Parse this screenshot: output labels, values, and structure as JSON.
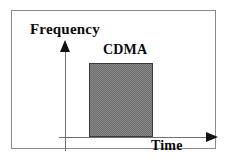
{
  "figure": {
    "name": "cdma-time-frequency-diagram",
    "background_color": "#ffffff",
    "frame_color": "#8a8a8a"
  },
  "chart_data": {
    "type": "area",
    "title": "",
    "xlabel": "Time",
    "ylabel": "Frequency",
    "grid": false,
    "legend": null,
    "axes": {
      "x": {
        "label": "Time",
        "arrow": "right",
        "ticks": [],
        "tick_labels": []
      },
      "y": {
        "label": "Frequency",
        "arrow": "up",
        "ticks": [],
        "tick_labels": []
      }
    },
    "series": [
      {
        "name": "CDMA",
        "label": "CDMA",
        "shape": "rectangle",
        "fill": "dithered-gray",
        "fill_color": "#808080",
        "border_color": "#3a3a3a",
        "x_start": 0.2,
        "x_end": 0.62,
        "y_start": 0.0,
        "y_end": 0.74
      }
    ],
    "annotations": [
      {
        "text": "CDMA",
        "position": "above-block"
      },
      {
        "text": "Frequency",
        "position": "y-axis-top"
      },
      {
        "text": "Time",
        "position": "x-axis-right"
      }
    ]
  },
  "labels": {
    "frequency": "Frequency",
    "cdma": "CDMA",
    "time": "Time"
  },
  "colors": {
    "block_fill": "#808080",
    "block_border": "#3a3a3a",
    "axis": "#6f6f6f",
    "arrow": "#111111",
    "text": "#0a0a0a",
    "frame": "#8a8a8a"
  }
}
